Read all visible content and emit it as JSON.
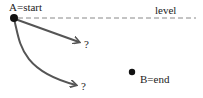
{
  "diagram": {
    "labels": {
      "start": "A=start",
      "level": "level",
      "straight_target": "?",
      "curved_target": "?",
      "end": "B=end"
    },
    "points": {
      "A": {
        "name": "start",
        "x": 14,
        "y": 18
      },
      "B": {
        "name": "end",
        "x": 132,
        "y": 72
      }
    },
    "paths": [
      {
        "id": "straight-path",
        "type": "straight-arrow",
        "from": "A",
        "to_label": "?"
      },
      {
        "id": "curved-path",
        "type": "curved-arrow",
        "from": "A",
        "to_label": "?"
      }
    ],
    "reference_line": {
      "label": "level",
      "style": "dashed"
    },
    "colors": {
      "ink": "#222222",
      "arrow": "#555555",
      "dashed_line": "#888888",
      "background": "#ffffff"
    }
  }
}
